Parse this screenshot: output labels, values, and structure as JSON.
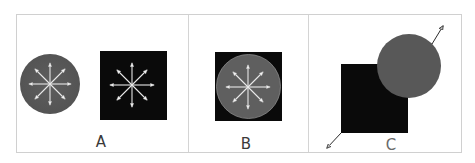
{
  "figure": {
    "background": "#ffffff",
    "frame_color": "#c8c8c8",
    "circle_fill": "#5a5a5a",
    "square_fill": "#0a0a0a",
    "arrow_color": "#f2f2f2",
    "outer_arrow_color": "#2a2a2a",
    "panels": [
      {
        "id": "A",
        "label": "A",
        "description": "Gray circle with eight outward arrows beside a black square with eight outward arrows"
      },
      {
        "id": "B",
        "label": "B",
        "description": "Gray circle with eight outward arrows inscribed inside a black square"
      },
      {
        "id": "C",
        "label": "C",
        "description": "Gray circle overlapping the top-right corner of a black square, arrows pointing apart diagonally"
      }
    ]
  }
}
